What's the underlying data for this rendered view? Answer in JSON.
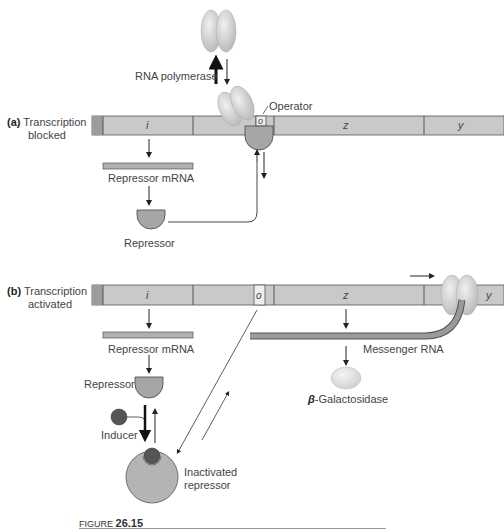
{
  "diagram": {
    "panel_a": {
      "label_letter": "(a)",
      "label_line1": "Transcription",
      "label_line2": "blocked",
      "rna_polymerase": "RNA polymerase",
      "operator": "Operator",
      "gene_i": "i",
      "gene_o": "o",
      "gene_z": "z",
      "gene_y": "y",
      "repressor_mrna": "Repressor mRNA",
      "repressor": "Repressor"
    },
    "panel_b": {
      "label_letter": "(b)",
      "label_line1": "Transcription",
      "label_line2": "activated",
      "gene_i": "i",
      "gene_o": "o",
      "gene_z": "z",
      "gene_y": "y",
      "repressor_mrna": "Repressor mRNA",
      "repressor": "Repressor",
      "inducer": "Inducer",
      "inactivated_line1": "Inactivated",
      "inactivated_line2": "repressor",
      "messenger_rna": "Messenger RNA",
      "beta_symbol": "β",
      "beta_gal": "-Galactosidase"
    },
    "figure": {
      "prefix": "FIGURE",
      "number": "26.15"
    },
    "colors": {
      "dna": "#c8c8c8",
      "dna_dark": "#a8a8a8",
      "repressor": "#a4a4a4",
      "inducer": "#555555",
      "polymerase": "#d6d6d6",
      "mrna": "#9a9a9a"
    }
  }
}
